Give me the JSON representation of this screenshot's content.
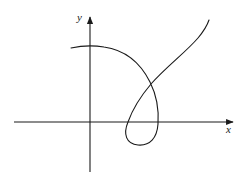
{
  "diagram": {
    "type": "parametric-curve-with-loop",
    "axes": {
      "x_label": "x",
      "y_label": "y",
      "origin_px": [
        90,
        122
      ],
      "x_axis": {
        "from": [
          14,
          122
        ],
        "to": [
          234,
          122
        ],
        "arrow": "right"
      },
      "y_axis": {
        "from": [
          90,
          172
        ],
        "to": [
          90,
          16
        ],
        "arrow": "up"
      }
    },
    "curve": {
      "description": "Curve starting left of y-axis near top, arcing right and down, crossing itself, looping below the x-axis, then rising to upper right",
      "key_points": [
        {
          "name": "start",
          "px": [
            71,
            47
          ]
        },
        {
          "name": "top-over-y-axis",
          "px": [
            90,
            46
          ]
        },
        {
          "name": "self-intersection",
          "px": [
            151,
            84
          ]
        },
        {
          "name": "right-x-crossing",
          "px": [
            158,
            122
          ]
        },
        {
          "name": "loop-bottom",
          "px": [
            137,
            145
          ]
        },
        {
          "name": "left-x-crossing",
          "px": [
            128,
            122
          ]
        },
        {
          "name": "end",
          "px": [
            209,
            20
          ]
        }
      ]
    },
    "colors": {
      "stroke": "#1a1a1a",
      "background": "#ffffff"
    }
  }
}
